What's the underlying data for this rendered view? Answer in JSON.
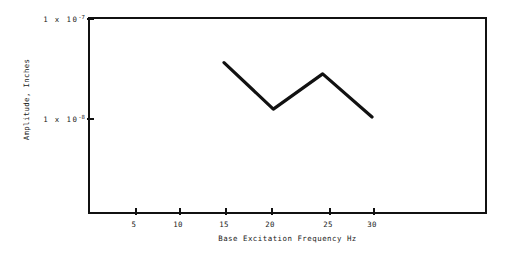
{
  "chart_data": {
    "type": "line",
    "title": "",
    "subtitle": "",
    "xlabel": "Base Excitation Frequency Hz",
    "ylabel": "Amplitude, Inches",
    "yscale": "log",
    "xscale": "linear",
    "xlim": [
      0,
      43
    ],
    "ylim": [
      1e-08,
      1e-07
    ],
    "grid": false,
    "legend": null,
    "x": [
      15,
      20,
      25,
      30
    ],
    "values": [
      3.5e-08,
      1.2e-08,
      2.7e-08,
      1e-08
    ],
    "series": [
      {
        "name": "Amplitude response",
        "x": [
          15,
          20,
          25,
          30
        ],
        "values": [
          3.5e-08,
          1.2e-08,
          2.7e-08,
          1e-08
        ]
      }
    ],
    "x_ticks": [
      {
        "value": 5,
        "label": "5"
      },
      {
        "value": 10,
        "label": "10"
      },
      {
        "value": 15,
        "label": "15"
      },
      {
        "value": 20,
        "label": "20"
      },
      {
        "value": 25,
        "label": "25"
      },
      {
        "value": 30,
        "label": "30"
      }
    ],
    "y_ticks": [
      {
        "value": 1e-07,
        "mantissa": "1  x  10",
        "exponent": "-7",
        "label": "1 x 10-7"
      },
      {
        "value": 1e-08,
        "mantissa": "1  x  10",
        "exponent": "-8",
        "label": "1 x 10-8"
      }
    ],
    "colors": {
      "line": "#111111",
      "axis": "#111111",
      "text": "#1a1a1a",
      "background": "#ffffff"
    }
  }
}
